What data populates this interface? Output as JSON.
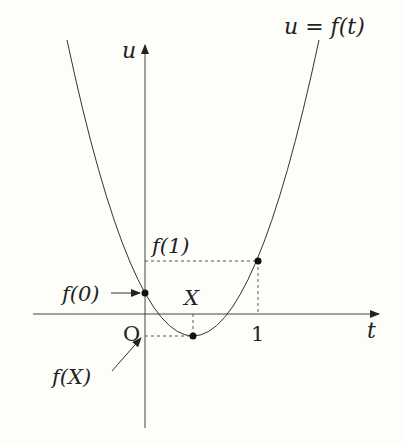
{
  "diagram": {
    "type": "function-graph",
    "curve_label": "u = f(t)",
    "axes": {
      "horizontal": {
        "label": "t"
      },
      "vertical": {
        "label": "u"
      },
      "origin_label": "O"
    },
    "ticks": {
      "t_one": "1"
    },
    "points": [
      {
        "name": "f0",
        "label": "f(0)",
        "t": 0
      },
      {
        "name": "vertex",
        "label": "f(X)",
        "t": "X"
      },
      {
        "name": "f1",
        "label": "f(1)",
        "t": 1
      }
    ],
    "labels": {
      "f0": "f(0)",
      "f1": "f(1)",
      "fX": "f(X)",
      "X": "X",
      "one": "1",
      "O": "O",
      "t": "t",
      "u": "u",
      "curve": "u = f(t)"
    },
    "colors": {
      "stroke": "#222222",
      "background": "#fdfdfa"
    }
  }
}
